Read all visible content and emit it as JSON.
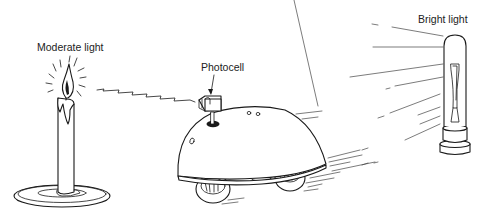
{
  "diagram": {
    "labels": {
      "moderate_light": "Moderate light",
      "photocell": "Photocell",
      "bright_light": "Bright light"
    },
    "objects": [
      {
        "name": "candle",
        "description": "Lit candle on a dish",
        "label": "Moderate light"
      },
      {
        "name": "robot",
        "description": "Dome-shaped robot on wheels with photocell on top, moving toward bright light"
      },
      {
        "name": "light-bulb",
        "description": "Tubular bulb emitting rays",
        "label": "Bright light"
      }
    ],
    "colors": {
      "ink": "#1a1a1a",
      "background": "#ffffff"
    }
  }
}
